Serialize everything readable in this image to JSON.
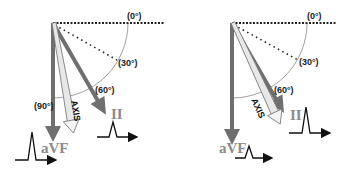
{
  "colors": {
    "lead_arrow": "#6f6f6f",
    "axis_fill": "#e8e8e8",
    "axis_stroke": "#777777",
    "arc": "#888888",
    "reference_line": "#222222",
    "ecg": "#111111"
  },
  "panels": [
    {
      "id": "left",
      "angles": {
        "zero": "(0°)",
        "thirty": "(30°)",
        "sixty": "(60°)",
        "ninety": "(90°)"
      },
      "leads": {
        "inferior": "aVF",
        "lead_ii": "II"
      },
      "axis_label": "AXIS",
      "axis_angle_deg": 80,
      "complexes": {
        "avf": "large",
        "ii": "small"
      }
    },
    {
      "id": "right",
      "angles": {
        "zero": "(0°)",
        "thirty": "(30°)",
        "sixty": "(60°)"
      },
      "leads": {
        "inferior": "aVF",
        "lead_ii": "II"
      },
      "axis_label": "AXIS",
      "axis_angle_deg": 65,
      "complexes": {
        "avf": "small",
        "ii": "large"
      }
    }
  ]
}
